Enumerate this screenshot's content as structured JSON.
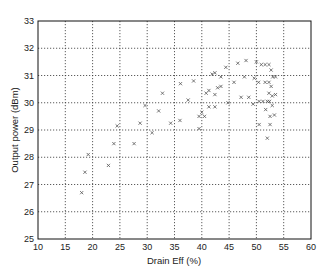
{
  "chart_data": {
    "type": "scatter",
    "title": "",
    "xlabel": "Drain Eff (%)",
    "ylabel": "Output power (dBm)",
    "xlim": [
      10,
      60
    ],
    "ylim": [
      25,
      33
    ],
    "xticks": [
      10,
      15,
      20,
      25,
      30,
      35,
      40,
      45,
      50,
      55,
      60
    ],
    "yticks": [
      25,
      26,
      27,
      28,
      29,
      30,
      31,
      32,
      33
    ],
    "grid": true,
    "legend": null,
    "marker": "x",
    "marker_color": "#555555",
    "series": [
      {
        "name": "measurements",
        "points": [
          [
            18.0,
            26.7
          ],
          [
            18.6,
            27.45
          ],
          [
            19.2,
            28.1
          ],
          [
            22.9,
            27.7
          ],
          [
            23.9,
            28.5
          ],
          [
            24.5,
            29.15
          ],
          [
            27.6,
            28.5
          ],
          [
            28.7,
            29.25
          ],
          [
            29.6,
            29.9
          ],
          [
            30.9,
            28.9
          ],
          [
            32.1,
            29.7
          ],
          [
            32.8,
            30.35
          ],
          [
            34.3,
            29.25
          ],
          [
            36.1,
            30.7
          ],
          [
            36.0,
            29.35
          ],
          [
            37.5,
            30.1
          ],
          [
            38.5,
            30.8
          ],
          [
            39.5,
            29.5
          ],
          [
            39.5,
            29.05
          ],
          [
            40.0,
            29.65
          ],
          [
            40.5,
            29.5
          ],
          [
            40.8,
            30.35
          ],
          [
            41.3,
            30.45
          ],
          [
            41.3,
            29.85
          ],
          [
            41.9,
            31.05
          ],
          [
            42.4,
            31.1
          ],
          [
            42.4,
            30.3
          ],
          [
            42.4,
            29.85
          ],
          [
            42.9,
            30.55
          ],
          [
            43.5,
            30.6
          ],
          [
            43.5,
            30.95
          ],
          [
            44.4,
            31.3
          ],
          [
            44.8,
            30.0
          ],
          [
            45.9,
            30.75
          ],
          [
            46.6,
            31.45
          ],
          [
            47.2,
            30.2
          ],
          [
            47.8,
            30.95
          ],
          [
            48.1,
            31.55
          ],
          [
            48.6,
            30.2
          ],
          [
            49.4,
            29.95
          ],
          [
            49.6,
            30.9
          ],
          [
            50.0,
            31.5
          ],
          [
            50.4,
            30.75
          ],
          [
            50.5,
            30.05
          ],
          [
            50.5,
            29.2
          ],
          [
            50.9,
            31.4
          ],
          [
            51.2,
            30.05
          ],
          [
            51.6,
            31.4
          ],
          [
            51.6,
            30.75
          ],
          [
            51.7,
            29.75
          ],
          [
            52.0,
            30.05
          ],
          [
            52.0,
            28.7
          ],
          [
            52.3,
            31.4
          ],
          [
            52.3,
            30.75
          ],
          [
            52.3,
            30.35
          ],
          [
            52.4,
            30.05
          ],
          [
            52.5,
            29.5
          ],
          [
            52.5,
            29.2
          ],
          [
            52.7,
            31.2
          ],
          [
            52.7,
            30.6
          ],
          [
            52.9,
            30.25
          ],
          [
            52.9,
            29.9
          ],
          [
            53.0,
            30.95
          ],
          [
            53.3,
            29.55
          ],
          [
            53.5,
            30.3
          ],
          [
            53.5,
            30.95
          ]
        ]
      }
    ]
  }
}
